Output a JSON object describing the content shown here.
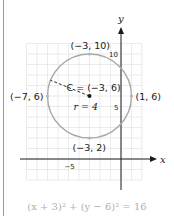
{
  "diagram": {
    "axes": {
      "x_label": "x",
      "y_label": "y",
      "x_tick_labels": [
        {
          "value": -5,
          "text": "−5"
        }
      ],
      "y_tick_labels": [
        {
          "value": 10,
          "text": "10"
        },
        {
          "value": 5,
          "text": "5"
        }
      ]
    },
    "grid": {
      "x_min": -9,
      "x_max": 2,
      "y_min": -2,
      "y_max": 11
    },
    "circle": {
      "center": [
        -3,
        6
      ],
      "radius": 4,
      "center_label": "C = (−3, 6)",
      "radius_label": "r = 4",
      "stroke_color": "#a8a8a8"
    },
    "points": [
      {
        "name": "top",
        "coords": [
          -3,
          10
        ],
        "label": "(−3, 10)"
      },
      {
        "name": "bottom",
        "coords": [
          -3,
          2
        ],
        "label": "(−3, 2)"
      },
      {
        "name": "left",
        "coords": [
          -7,
          6
        ],
        "label": "(−7, 6)"
      },
      {
        "name": "right",
        "coords": [
          1,
          6
        ],
        "label": "(1, 6)"
      }
    ],
    "equation": "(x + 3)² + (y − 6)² = 16",
    "colors": {
      "grid": "#e6e6e6",
      "axis": "#1a1a1a",
      "circle": "#a8a8a8",
      "point_marker": "#b5b5b5",
      "equation_text": "#b0b0b0"
    }
  }
}
